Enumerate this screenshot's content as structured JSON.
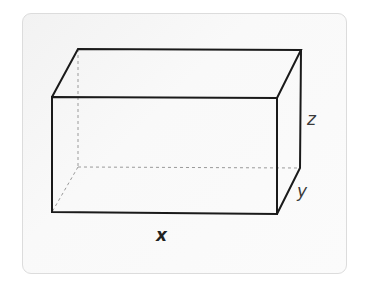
{
  "figure": {
    "type": "rectangular-prism",
    "labels": {
      "x": "x",
      "y": "y",
      "z": "z"
    },
    "colors": {
      "edge": "#1a1a1a",
      "hidden_edge": "#9a9a9a",
      "card_border": "#dcdcdc",
      "card_background": "#f7f7f7"
    },
    "vertices": {
      "front_top_left": [
        52,
        97
      ],
      "front_top_right": [
        277,
        98
      ],
      "front_bottom_left": [
        52,
        212
      ],
      "front_bottom_right": [
        277,
        214
      ],
      "back_top_left": [
        78,
        49
      ],
      "back_top_right": [
        301,
        50
      ],
      "back_bottom_left": [
        78,
        167
      ],
      "back_bottom_right": [
        300,
        168
      ]
    }
  }
}
